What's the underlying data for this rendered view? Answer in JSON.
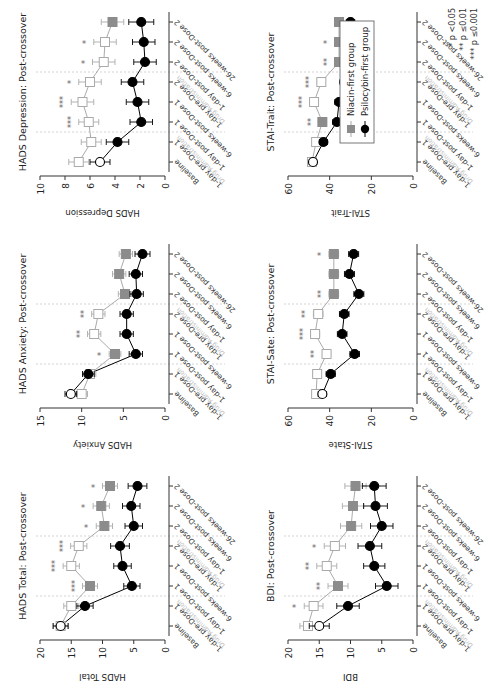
{
  "figure": {
    "categories": [
      "Baseline",
      "1-day pre-Dose 1",
      "1-day post-Dose 1",
      "6-weeks post-Dose 1",
      "1-day pre-Dose 2",
      "1-day post-Dose 2",
      "6-weeks post-Dose 2",
      "26-weeks post-Dose 2"
    ],
    "drug_admin_label": "Drug Administration",
    "legend": {
      "niacin_label": "Niacin-first group",
      "psilocybin_label": "Psilocybin-first group"
    },
    "significance_key": [
      "* p <0.05",
      "** p ≤0.01",
      "*** p ≤0.001"
    ],
    "colors": {
      "psilocybin": "#000000",
      "niacin_line": "#aaaaaa",
      "niacin_filled": "#8c8c8c",
      "axis": "#333333",
      "guide": "#c8c8c8",
      "drug_admin_text": "#c0c0c0"
    }
  },
  "chart_data": [
    {
      "type": "line",
      "title": "HADS Total: Post-crossover",
      "ylabel": "HADS Total",
      "ylim": [
        0,
        20
      ],
      "yticks": [
        0,
        5,
        10,
        15,
        20
      ],
      "categories": [
        "Baseline",
        "1-day pre-Dose 1",
        "1-day post-Dose 1",
        "6-weeks post-Dose 1",
        "1-day pre-Dose 2",
        "1-day post-Dose 2",
        "6-weeks post-Dose 2",
        "26-weeks post-Dose 2"
      ],
      "series": [
        {
          "name": "Niacin-first group",
          "values": [
            16.7,
            15.0,
            12.0,
            15.0,
            13.8,
            9.7,
            10.2,
            8.8
          ],
          "err": [
            1.2,
            1.2,
            1.2,
            1.3,
            1.3,
            1.3,
            1.3,
            1.2
          ]
        },
        {
          "name": "Psilocybin-first group",
          "values": [
            16.7,
            12.8,
            5.3,
            6.8,
            7.2,
            5.0,
            5.4,
            4.4
          ],
          "err": [
            1.2,
            1.3,
            1.3,
            1.4,
            1.5,
            1.4,
            1.4,
            1.5
          ]
        }
      ],
      "significance": [
        "",
        "",
        "***",
        "***",
        "***",
        "*",
        "*",
        "*"
      ]
    },
    {
      "type": "line",
      "title": "HADS Anxiety: Post-crossover",
      "ylabel": "HADS Anxiety",
      "ylim": [
        0,
        15
      ],
      "yticks": [
        0,
        5,
        10,
        15
      ],
      "categories": [
        "Baseline",
        "1-day pre-Dose 1",
        "1-day post-Dose 1",
        "6-weeks post-Dose 1",
        "1-day pre-Dose 2",
        "1-day post-Dose 2",
        "6-weeks post-Dose 2",
        "26-weeks post-Dose 2"
      ],
      "series": [
        {
          "name": "Niacin-first group",
          "values": [
            10.0,
            9.0,
            6.0,
            8.5,
            8.0,
            4.8,
            5.5,
            4.7
          ],
          "err": [
            0.7,
            0.7,
            0.7,
            0.8,
            0.8,
            0.8,
            0.8,
            0.8
          ]
        },
        {
          "name": "Psilocybin-first group",
          "values": [
            11.3,
            9.2,
            3.5,
            4.6,
            4.6,
            3.4,
            3.5,
            2.7
          ],
          "err": [
            0.7,
            0.7,
            0.8,
            0.8,
            0.8,
            0.8,
            0.8,
            0.9
          ]
        }
      ],
      "significance": [
        "",
        "",
        "*",
        "**",
        "**",
        "",
        "",
        ""
      ]
    },
    {
      "type": "line",
      "title": "HADS Depression: Post-crossover",
      "ylabel": "HADS Depression",
      "ylim": [
        0,
        10
      ],
      "yticks": [
        0,
        2,
        4,
        6,
        8,
        10
      ],
      "categories": [
        "Baseline",
        "1-day pre-Dose 1",
        "1-day post-Dose 1",
        "6-weeks post-Dose 1",
        "1-day pre-Dose 2",
        "1-day post-Dose 2",
        "6-weeks post-Dose 2",
        "26-weeks post-Dose 2"
      ],
      "series": [
        {
          "name": "Niacin-first group",
          "values": [
            6.9,
            5.9,
            6.1,
            6.6,
            6.0,
            4.9,
            4.8,
            4.2
          ],
          "err": [
            0.8,
            0.8,
            0.8,
            0.9,
            0.9,
            0.9,
            0.9,
            0.9
          ]
        },
        {
          "name": "Psilocybin-first group",
          "values": [
            5.2,
            3.8,
            1.9,
            2.2,
            2.6,
            1.6,
            1.7,
            1.9
          ],
          "err": [
            0.8,
            0.9,
            0.9,
            0.9,
            0.9,
            0.9,
            0.9,
            1.0
          ]
        }
      ],
      "significance": [
        "",
        "",
        "***",
        "***",
        "*",
        "*",
        "*",
        ""
      ]
    },
    {
      "type": "line",
      "title": "BDI: Post-crossover",
      "ylabel": "BDI",
      "ylim": [
        0,
        20
      ],
      "yticks": [
        0,
        5,
        10,
        15,
        20
      ],
      "categories": [
        "Baseline",
        "1-day pre-Dose 1",
        "1-day post-Dose 1",
        "6-weeks post-Dose 1",
        "1-day pre-Dose 2",
        "1-day post-Dose 2",
        "6-weeks post-Dose 2",
        "26-weeks post-Dose 2"
      ],
      "series": [
        {
          "name": "Niacin-first group",
          "values": [
            16.8,
            15.9,
            12.0,
            13.8,
            12.5,
            9.9,
            9.6,
            9.2
          ],
          "err": [
            1.3,
            1.5,
            1.6,
            1.6,
            1.7,
            1.7,
            1.7,
            1.7
          ]
        },
        {
          "name": "Psilocybin-first group",
          "values": [
            15.0,
            10.4,
            4.2,
            6.2,
            6.9,
            5.0,
            6.0,
            6.2
          ],
          "err": [
            1.6,
            1.8,
            1.8,
            1.7,
            1.9,
            1.8,
            1.9,
            1.9
          ]
        }
      ],
      "significance": [
        "",
        "*",
        "**",
        "**",
        "*",
        "",
        "",
        ""
      ]
    },
    {
      "type": "line",
      "title": "STAI-Sate: Post-crossover",
      "ylabel": "STAI-State",
      "ylim": [
        0,
        60
      ],
      "yticks": [
        0,
        20,
        40,
        60
      ],
      "categories": [
        "Baseline",
        "1-day pre-Dose 1",
        "1-day post-Dose 1",
        "6-weeks post-Dose 1",
        "1-day pre-Dose 2",
        "1-day post-Dose 2",
        "6-weeks post-Dose 2",
        "26-weeks post-Dose 2"
      ],
      "series": [
        {
          "name": "Niacin-first group",
          "values": [
            46.5,
            46.0,
            41.5,
            47.0,
            45.5,
            38.0,
            38.0,
            38.0
          ],
          "err": [
            2.0,
            2.0,
            2.0,
            2.2,
            2.3,
            2.3,
            2.3,
            2.3
          ]
        },
        {
          "name": "Psilocybin-first group",
          "values": [
            43.5,
            39.5,
            28.0,
            34.0,
            33.0,
            26.0,
            30.5,
            28.5
          ],
          "err": [
            2.0,
            2.2,
            2.3,
            2.3,
            2.3,
            2.4,
            2.4,
            2.4
          ]
        }
      ],
      "significance": [
        "",
        "",
        "**",
        "***",
        "**",
        "**",
        "",
        "*"
      ]
    },
    {
      "type": "line",
      "title": "STAI-Trait: Post-crossover",
      "ylabel": "STAI-Trait",
      "ylim": [
        0,
        60
      ],
      "yticks": [
        0,
        20,
        40,
        60
      ],
      "categories": [
        "Baseline",
        "1-day pre-Dose 1",
        "1-day post-Dose 1",
        "6-weeks post-Dose 1",
        "1-day pre-Dose 2",
        "1-day post-Dose 2",
        "6-weeks post-Dose 2",
        "26-weeks post-Dose 2"
      ],
      "series": [
        {
          "name": "Niacin-first group",
          "values": [
            48.5,
            46.5,
            43.5,
            47.5,
            44.0,
            35.5,
            35.5,
            35.5
          ],
          "err": [
            1.8,
            1.8,
            1.8,
            2.0,
            2.0,
            2.0,
            2.0,
            2.0
          ]
        },
        {
          "name": "Psilocybin-first group",
          "values": [
            48.0,
            43.0,
            36.5,
            35.5,
            33.0,
            30.0,
            30.0,
            30.0
          ],
          "err": [
            1.8,
            1.9,
            2.0,
            2.0,
            2.0,
            2.0,
            2.0,
            2.0
          ]
        }
      ],
      "significance": [
        "",
        "",
        "**",
        "***",
        "***",
        "**",
        "*",
        ""
      ]
    }
  ]
}
